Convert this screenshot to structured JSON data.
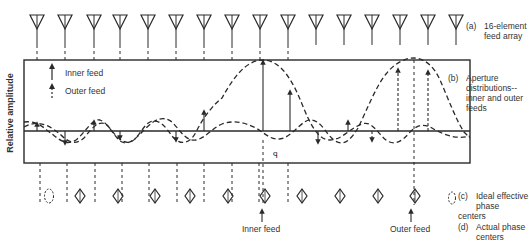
{
  "figure": {
    "y_axis_label": "Relative amplitude",
    "legend": {
      "inner_feed": "Inner feed",
      "outer_feed": "Outer feed"
    },
    "labels": {
      "a_tag": "(a)",
      "a_text_1": "16-element",
      "a_text_2": "feed array",
      "b_tag": "(b)",
      "b_text_1": "Aperture",
      "b_text_2": "distributions--",
      "b_text_3": "inner and outer",
      "b_text_4": "feeds",
      "c_tag": "(c)",
      "c_text_1": "Ideal effective",
      "c_text_2": "phase centers",
      "d_tag": "(d)",
      "d_text_1": "Actual phase",
      "d_text_2": "centers"
    },
    "pointers": {
      "inner_feed": "Inner feed",
      "outer_feed": "Outer feed"
    },
    "feed_count": 16,
    "feed_x": [
      37,
      65,
      94,
      120,
      148,
      176,
      204,
      232,
      260,
      288,
      316,
      344,
      372,
      400,
      428,
      456
    ],
    "phase_center_x": [
      80,
      118,
      155,
      190,
      228,
      265,
      302,
      340,
      378,
      415
    ],
    "ideal_phase_center_x": 49,
    "inner_feed_x": 263,
    "outer_feed_x": 414,
    "colors": {
      "ink": "#2a2a2a",
      "background": "#ffffff"
    }
  }
}
